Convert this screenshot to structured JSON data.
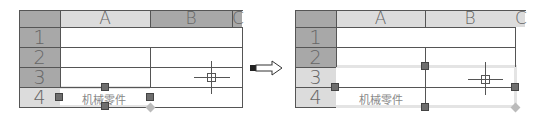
{
  "left_table": {
    "columns": [
      "A",
      "B",
      "C"
    ],
    "rows": [
      "1",
      "2",
      "3",
      "4"
    ],
    "cell_text": "机械零件",
    "state": "before"
  },
  "arrow": {
    "icon": "right-arrow-icon"
  },
  "right_table": {
    "columns": [
      "A",
      "B",
      "C"
    ],
    "rows": [
      "1",
      "2",
      "3",
      "4"
    ],
    "cell_text": "机械零件",
    "state": "after"
  },
  "colors": {
    "header_dark": "#a8a8a8",
    "header_light": "#dcdcdc",
    "grid_line": "#555555",
    "handle": "#6e6e6e",
    "selection_band": "#e4e4e4"
  }
}
